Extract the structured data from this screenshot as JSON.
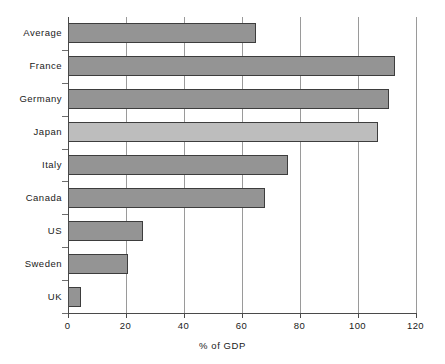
{
  "chart_data": {
    "type": "bar",
    "orientation": "horizontal",
    "title": "",
    "subtitle": "",
    "xlabel": "% of GDP",
    "ylabel": "",
    "categories": [
      "Average",
      "France",
      "Germany",
      "Japan",
      "Italy",
      "Canada",
      "US",
      "Sweden",
      "UK"
    ],
    "values": [
      65,
      113,
      111,
      107,
      76,
      68,
      26,
      21,
      4.5
    ],
    "series": [
      {
        "name": "% of GDP",
        "values": [
          65,
          113,
          111,
          107,
          76,
          68,
          26,
          21,
          4.5
        ]
      }
    ],
    "xlim": [
      0,
      120
    ],
    "ylim": null,
    "xticks": [
      0,
      20,
      40,
      60,
      80,
      100,
      120
    ],
    "xtick_labels": [
      "0",
      "20",
      "40",
      "60",
      "80",
      "100",
      "120"
    ],
    "grid": "vertical",
    "legend": null,
    "legend_position": "none",
    "annotations": [],
    "bar_colors": [
      "#949494",
      "#949494",
      "#949494",
      "#bdbdbd",
      "#949494",
      "#949494",
      "#949494",
      "#949494",
      "#949494"
    ],
    "bar_border_color": "#3d3d3d",
    "background_color": "#ffffff",
    "gridline_color": "#9a9a9a",
    "axis_color": "#4a4a4a",
    "text_color": "#1a1a1a"
  }
}
